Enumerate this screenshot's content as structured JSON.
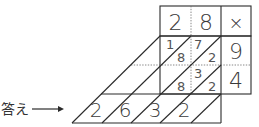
{
  "diagram": {
    "type": "lattice-multiplication",
    "multiplicand_digits": [
      "2",
      "8"
    ],
    "operator_symbol": "×",
    "multiplier_digits": [
      "9",
      "4"
    ],
    "cells": [
      {
        "row": 0,
        "col": 0,
        "tens": "1",
        "ones": "8"
      },
      {
        "row": 0,
        "col": 1,
        "tens": "7",
        "ones": "2"
      },
      {
        "row": 1,
        "col": 0,
        "tens": "",
        "ones": "8"
      },
      {
        "row": 1,
        "col": 1,
        "tens": "3",
        "ones": "2"
      }
    ],
    "answer_digits": [
      "2",
      "6",
      "3",
      "2"
    ],
    "answer_label": "答え",
    "arrow_icon": "right-arrow-icon",
    "line_color": "#2a2a2a"
  }
}
